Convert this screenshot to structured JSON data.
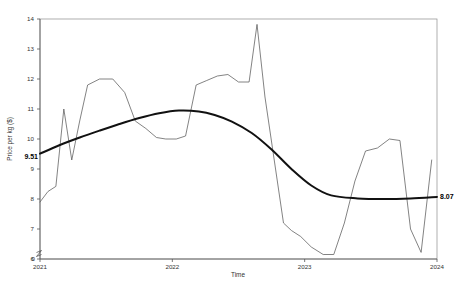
{
  "chart_data": {
    "type": "line",
    "title": "",
    "xlabel": "Time",
    "ylabel": "Price per kg ($)",
    "xlim": [
      2021.0,
      2024.0
    ],
    "ylim": [
      6,
      14
    ],
    "y_axis_break": true,
    "y_zero_tick": "0",
    "grid": false,
    "legend_position": "none",
    "x_tick_labels": [
      "2021",
      "2022",
      "2023",
      "2024"
    ],
    "x_tick_values": [
      2021,
      2022,
      2023,
      2024
    ],
    "y_tick_labels": [
      "6",
      "7",
      "8",
      "9",
      "10",
      "11",
      "12",
      "13",
      "14"
    ],
    "y_tick_values": [
      6,
      7,
      8,
      9,
      10,
      11,
      12,
      13,
      14
    ],
    "series": [
      {
        "name": "Price per kg",
        "style": "thin-observed",
        "color": "#5a5a5a",
        "x": [
          2021.0,
          2021.06,
          2021.12,
          2021.18,
          2021.24,
          2021.3,
          2021.36,
          2021.45,
          2021.55,
          2021.64,
          2021.72,
          2021.8,
          2021.88,
          2021.95,
          2022.03,
          2022.1,
          2022.18,
          2022.26,
          2022.34,
          2022.42,
          2022.5,
          2022.58,
          2022.64,
          2022.7,
          2022.78,
          2022.84,
          2022.9,
          2022.97,
          2023.05,
          2023.14,
          2023.22,
          2023.3,
          2023.38,
          2023.46,
          2023.55,
          2023.64,
          2023.72,
          2023.8,
          2023.88,
          2023.96
        ],
        "y": [
          7.9,
          8.25,
          8.42,
          11.0,
          9.3,
          10.6,
          11.8,
          12.0,
          12.0,
          11.55,
          10.6,
          10.35,
          10.05,
          10.0,
          10.0,
          10.1,
          11.8,
          11.95,
          12.1,
          12.15,
          11.9,
          11.9,
          13.82,
          11.4,
          9.0,
          7.2,
          6.95,
          6.75,
          6.4,
          6.15,
          6.15,
          7.2,
          8.6,
          9.6,
          9.7,
          10.0,
          9.95,
          7.0,
          6.22,
          9.3
        ]
      },
      {
        "name": "Trend",
        "style": "thick-smooth",
        "color": "#111111",
        "x": [
          2021.0,
          2021.15,
          2021.3,
          2021.45,
          2021.6,
          2021.75,
          2021.9,
          2022.05,
          2022.2,
          2022.32,
          2022.45,
          2022.6,
          2022.75,
          2022.9,
          2023.05,
          2023.2,
          2023.4,
          2023.6,
          2023.8,
          2024.0
        ],
        "y": [
          9.51,
          9.8,
          10.05,
          10.28,
          10.5,
          10.7,
          10.86,
          10.95,
          10.92,
          10.8,
          10.58,
          10.2,
          9.65,
          9.0,
          8.45,
          8.12,
          8.02,
          8.0,
          8.02,
          8.07
        ]
      }
    ],
    "annotations": [
      {
        "name": "trend-start-value",
        "text": "9.51",
        "x": 2021.0,
        "y": 9.51,
        "bold": true
      },
      {
        "name": "trend-end-value",
        "text": "8.07",
        "x": 2024.0,
        "y": 8.07,
        "bold": true
      }
    ]
  }
}
